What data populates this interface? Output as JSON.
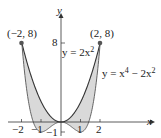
{
  "chart_data": {
    "type": "area",
    "title": "",
    "xlabel": "x",
    "ylabel": "y",
    "xlim": [
      -2.1,
      2.6
    ],
    "ylim": [
      -1.5,
      9.5
    ],
    "x_ticks": [
      -2,
      -1,
      1,
      2
    ],
    "x_tick_labels": [
      "−2",
      "−1",
      "1",
      "2"
    ],
    "y_ticks": [
      8,
      -1
    ],
    "y_tick_labels": [
      "8",
      "−1"
    ],
    "series": [
      {
        "name": "y = 2x^2",
        "expr": "2x^2",
        "x": [
          -2,
          -1,
          0,
          1,
          2
        ],
        "values": [
          8,
          2,
          0,
          2,
          8
        ]
      },
      {
        "name": "y = x^4 − 2x^2",
        "expr": "x^4 - 2x^2",
        "x": [
          -2,
          -1,
          0,
          1,
          2
        ],
        "values": [
          8,
          -1,
          0,
          -1,
          8
        ]
      }
    ],
    "shaded_region": "between y = 2x^2 and y = x^4 − 2x^2 for −2 ≤ x ≤ 2",
    "points": [
      {
        "label": "(−2, 8)",
        "x": -2,
        "y": 8
      },
      {
        "label": "(2, 8)",
        "x": 2,
        "y": 8
      }
    ],
    "annotations": [
      "y = 2x²",
      "y = x⁴ − 2x²"
    ],
    "grid": false
  },
  "labels": {
    "y_axis": "y",
    "x_axis": "x",
    "point_left": "(−2, 8)",
    "point_right": "(2, 8)",
    "curve1": "y = 2x",
    "curve1_sup": "2",
    "curve2": "y = x",
    "curve2_sup1": "4",
    "curve2_mid": " − 2x",
    "curve2_sup2": "2",
    "tick_x_m2": "−2",
    "tick_x_m1": "−1",
    "tick_x_1": "1",
    "tick_x_2": "2",
    "tick_y_8": "8",
    "tick_y_m1": "−1"
  }
}
